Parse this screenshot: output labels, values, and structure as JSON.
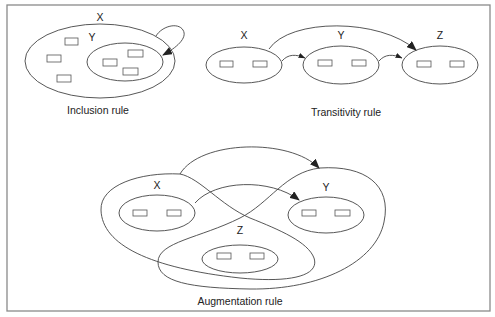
{
  "figure": {
    "panels": [
      {
        "id": "inclusion",
        "caption": "Inclusion rule",
        "sets": [
          {
            "label": "X",
            "role": "outer-set",
            "element_count": 3
          },
          {
            "label": "Y",
            "role": "subset",
            "element_count": 3
          }
        ],
        "arrows": [
          {
            "from": "X",
            "to": "Y",
            "style": "self-loop"
          }
        ]
      },
      {
        "id": "transitivity",
        "caption": "Transitivity rule",
        "sets": [
          {
            "label": "X",
            "element_count": 2
          },
          {
            "label": "Y",
            "element_count": 2
          },
          {
            "label": "Z",
            "element_count": 2
          }
        ],
        "arrows": [
          {
            "from": "X",
            "to": "Y"
          },
          {
            "from": "Y",
            "to": "Z"
          },
          {
            "from": "X",
            "to": "Z"
          }
        ]
      },
      {
        "id": "augmentation",
        "caption": "Augmentation rule",
        "sets": [
          {
            "label": "X",
            "element_count": 2
          },
          {
            "label": "Y",
            "element_count": 2
          },
          {
            "label": "Z",
            "element_count": 2
          }
        ],
        "regions": [
          {
            "label": "XZ",
            "contains": [
              "X",
              "Z"
            ]
          },
          {
            "label": "YZ",
            "contains": [
              "Y",
              "Z"
            ]
          }
        ],
        "arrows": [
          {
            "from": "X",
            "to": "Y"
          },
          {
            "from": "XZ",
            "to": "YZ"
          }
        ]
      }
    ]
  },
  "labels": {
    "inc_x": "X",
    "inc_y": "Y",
    "tr_x": "X",
    "tr_y": "Y",
    "tr_z": "Z",
    "aug_x": "X",
    "aug_y": "Y",
    "aug_z": "Z",
    "inclusion_caption": "Inclusion rule",
    "transitivity_caption": "Transitivity rule",
    "augmentation_caption": "Augmentation rule"
  },
  "colors": {
    "stroke": "#444444",
    "frame": "#8a8a8a",
    "background": "#ffffff"
  }
}
